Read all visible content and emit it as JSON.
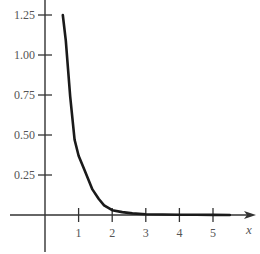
{
  "chart_data": {
    "type": "line",
    "title": "",
    "xlabel": "x",
    "ylabel": "",
    "xlim": [
      -1,
      6
    ],
    "ylim": [
      -0.25,
      1.35
    ],
    "grid": false,
    "legend": null,
    "x_ticks": [
      {
        "value": 1,
        "label": "1"
      },
      {
        "value": 2,
        "label": "2"
      },
      {
        "value": 3,
        "label": "3"
      },
      {
        "value": 4,
        "label": "4"
      },
      {
        "value": 5,
        "label": "5"
      }
    ],
    "y_ticks": [
      {
        "value": 0.25,
        "label": "0.25"
      },
      {
        "value": 0.5,
        "label": "0.50"
      },
      {
        "value": 0.75,
        "label": "0.75"
      },
      {
        "value": 1.0,
        "label": "1.00"
      },
      {
        "value": 1.25,
        "label": "1.25"
      }
    ],
    "series": [
      {
        "name": "curve",
        "color": "#1a1a1a",
        "x": [
          0.53,
          0.62,
          0.75,
          0.88,
          1.0,
          1.18,
          1.41,
          1.6,
          1.76,
          2.0,
          2.3,
          2.6,
          3.0,
          3.5,
          4.0,
          4.5,
          5.0,
          5.5
        ],
        "y": [
          1.25,
          1.09,
          0.74,
          0.47,
          0.37,
          0.28,
          0.16,
          0.1,
          0.06,
          0.03,
          0.018,
          0.01,
          0.005,
          0.003,
          0.002,
          0.001,
          0.0005,
          0.0003
        ]
      }
    ]
  },
  "axes": {
    "x_axis_label": "x"
  }
}
